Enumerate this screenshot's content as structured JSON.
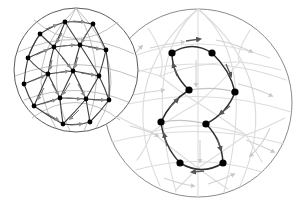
{
  "figure": {
    "background_color": "#ffffff",
    "width": 305,
    "height": 213,
    "caption": ""
  },
  "colors": {
    "sphere_outline": "#6f6f6f",
    "dense_edge": "#3a3a3a",
    "dense_edge_light": "#9a9a9a",
    "faint_edge": "#d8d8d8",
    "faint_edge_soft": "#e4e4e4",
    "highlight_edge": "#2a2a2a",
    "vertex_fill": "#000000",
    "arrow_dark": "#555555",
    "arrow_light": "#c9c9c9"
  },
  "spheres": [
    {
      "name": "small-sphere",
      "label": "dense triangulated sphere",
      "cx": 76,
      "cy": 70,
      "r": 62,
      "vertex_count": 17,
      "highlighted": false
    },
    {
      "name": "large-sphere",
      "label": "sphere with highlighted cycle",
      "cx": 198,
      "cy": 103,
      "r": 94,
      "vertex_count": 8,
      "highlighted": true
    }
  ],
  "small_sphere_vertices": [
    {
      "x": 40,
      "y": 34
    },
    {
      "x": 65,
      "y": 22
    },
    {
      "x": 93,
      "y": 24
    },
    {
      "x": 28,
      "y": 58
    },
    {
      "x": 54,
      "y": 47
    },
    {
      "x": 80,
      "y": 45
    },
    {
      "x": 106,
      "y": 50
    },
    {
      "x": 24,
      "y": 84
    },
    {
      "x": 48,
      "y": 74
    },
    {
      "x": 73,
      "y": 71
    },
    {
      "x": 99,
      "y": 76
    },
    {
      "x": 34,
      "y": 106
    },
    {
      "x": 60,
      "y": 98
    },
    {
      "x": 86,
      "y": 99
    },
    {
      "x": 109,
      "y": 100
    },
    {
      "x": 63,
      "y": 124
    },
    {
      "x": 90,
      "y": 122
    }
  ],
  "small_sphere_edges": [
    [
      0,
      1
    ],
    [
      1,
      2
    ],
    [
      0,
      4
    ],
    [
      1,
      4
    ],
    [
      1,
      5
    ],
    [
      2,
      5
    ],
    [
      2,
      6
    ],
    [
      3,
      4
    ],
    [
      4,
      5
    ],
    [
      5,
      6
    ],
    [
      3,
      0
    ],
    [
      3,
      8
    ],
    [
      4,
      8
    ],
    [
      4,
      9
    ],
    [
      5,
      9
    ],
    [
      5,
      10
    ],
    [
      6,
      10
    ],
    [
      7,
      8
    ],
    [
      8,
      9
    ],
    [
      9,
      10
    ],
    [
      7,
      3
    ],
    [
      7,
      11
    ],
    [
      8,
      11
    ],
    [
      8,
      12
    ],
    [
      9,
      12
    ],
    [
      9,
      13
    ],
    [
      10,
      13
    ],
    [
      10,
      14
    ],
    [
      11,
      12
    ],
    [
      12,
      13
    ],
    [
      13,
      14
    ],
    [
      11,
      15
    ],
    [
      12,
      15
    ],
    [
      13,
      15
    ],
    [
      13,
      16
    ],
    [
      14,
      16
    ],
    [
      15,
      16
    ],
    [
      6,
      14
    ],
    [
      0,
      3
    ],
    [
      2,
      1
    ]
  ],
  "large_sphere_cycle": {
    "name": "highlighted-directed-cycle",
    "directed": true,
    "vertices": [
      {
        "id": "v1",
        "x": 172,
        "y": 53
      },
      {
        "id": "v2",
        "x": 212,
        "y": 53
      },
      {
        "id": "v3",
        "x": 235,
        "y": 92
      },
      {
        "id": "v4",
        "x": 206,
        "y": 124
      },
      {
        "id": "v5",
        "x": 223,
        "y": 163
      },
      {
        "id": "v6",
        "x": 180,
        "y": 163
      },
      {
        "id": "v7",
        "x": 161,
        "y": 122
      },
      {
        "id": "v8",
        "x": 189,
        "y": 90
      }
    ],
    "edges": [
      {
        "from": "v1",
        "to": "v2",
        "curve": -14
      },
      {
        "from": "v2",
        "to": "v3",
        "curve": 7
      },
      {
        "from": "v3",
        "to": "v4",
        "curve": 8
      },
      {
        "from": "v4",
        "to": "v5",
        "curve": -9
      },
      {
        "from": "v5",
        "to": "v6",
        "curve": -12
      },
      {
        "from": "v6",
        "to": "v7",
        "curve": 9
      },
      {
        "from": "v7",
        "to": "v8",
        "curve": 9
      },
      {
        "from": "v8",
        "to": "v1",
        "curve": 8
      }
    ],
    "chords": [
      {
        "from": "v8",
        "to": "v3",
        "curve": 3
      },
      {
        "from": "v7",
        "to": "v4",
        "curve": 3
      }
    ]
  },
  "large_sphere_background_network": {
    "name": "faint-background-graph",
    "description": "pale gray spherical mesh behind highlighted cycle",
    "nodes": [
      {
        "x": 198,
        "y": 14
      },
      {
        "x": 148,
        "y": 28
      },
      {
        "x": 250,
        "y": 30
      },
      {
        "x": 116,
        "y": 66
      },
      {
        "x": 281,
        "y": 70
      },
      {
        "x": 110,
        "y": 112
      },
      {
        "x": 285,
        "y": 118
      },
      {
        "x": 137,
        "y": 160
      },
      {
        "x": 262,
        "y": 162
      },
      {
        "x": 176,
        "y": 190
      },
      {
        "x": 228,
        "y": 189
      },
      {
        "x": 198,
        "y": 103
      },
      {
        "x": 160,
        "y": 75
      },
      {
        "x": 240,
        "y": 60
      },
      {
        "x": 152,
        "y": 132
      },
      {
        "x": 246,
        "y": 135
      },
      {
        "x": 198,
        "y": 45
      },
      {
        "x": 198,
        "y": 168
      }
    ],
    "edges": [
      [
        0,
        1
      ],
      [
        0,
        2
      ],
      [
        1,
        3
      ],
      [
        2,
        4
      ],
      [
        3,
        5
      ],
      [
        4,
        6
      ],
      [
        5,
        7
      ],
      [
        6,
        8
      ],
      [
        7,
        9
      ],
      [
        8,
        10
      ],
      [
        9,
        10
      ],
      [
        0,
        16
      ],
      [
        16,
        12
      ],
      [
        16,
        13
      ],
      [
        12,
        11
      ],
      [
        13,
        11
      ],
      [
        11,
        14
      ],
      [
        11,
        15
      ],
      [
        14,
        17
      ],
      [
        15,
        17
      ],
      [
        1,
        12
      ],
      [
        2,
        13
      ],
      [
        3,
        12
      ],
      [
        4,
        13
      ],
      [
        5,
        14
      ],
      [
        6,
        15
      ],
      [
        7,
        14
      ],
      [
        8,
        15
      ],
      [
        9,
        17
      ],
      [
        10,
        17
      ],
      [
        1,
        16
      ],
      [
        2,
        16
      ],
      [
        12,
        14
      ],
      [
        13,
        15
      ],
      [
        3,
        11
      ],
      [
        4,
        11
      ],
      [
        0,
        11
      ]
    ]
  },
  "annotations": {
    "arrow_marker": "arrowhead-icon",
    "vertex_marker": "vertex-dot-icon"
  }
}
